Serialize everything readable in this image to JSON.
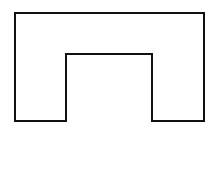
{
  "diagram": {
    "type": "outline-shape",
    "shape": "inverted-u",
    "stroke_color": "#111111",
    "fill_color": "none",
    "stroke_width": 2,
    "background": "#ffffff",
    "vertices": [
      [
        15,
        13
      ],
      [
        204,
        13
      ],
      [
        204,
        121
      ],
      [
        152,
        121
      ],
      [
        152,
        54
      ],
      [
        66,
        54
      ],
      [
        66,
        121
      ],
      [
        15,
        121
      ]
    ]
  }
}
